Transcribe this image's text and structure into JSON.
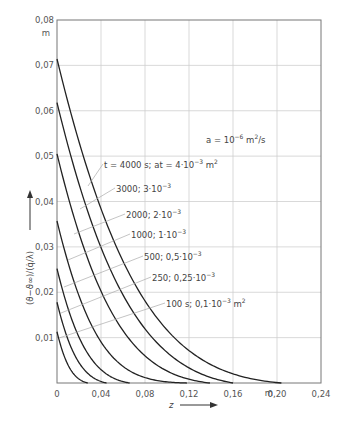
{
  "chart_data": {
    "type": "line",
    "title": "",
    "xlabel": "z",
    "x_unit": "m",
    "ylabel": "(ϑ − ϑ∞) / (q̇ / λ)",
    "y_unit": "m",
    "xlim": [
      0,
      0.24
    ],
    "ylim": [
      0,
      0.08
    ],
    "x_ticks": [
      "0",
      "0,04",
      "0,08",
      "0,12",
      "0,16",
      "0,20",
      "0,24"
    ],
    "y_ticks": [
      "0,01",
      "0,02",
      "0,03",
      "0,04",
      "0,05",
      "0,06",
      "0,07",
      "0,08"
    ],
    "grid": true,
    "annotation": "a = 10⁻⁶ m²/s",
    "series": [
      {
        "name": "t = 4000 s; at = 4·10⁻³ m²",
        "t_s": 4000,
        "at": 0.004,
        "y0": 0.0714,
        "z_end": 0.204
      },
      {
        "name": "3000; 3·10⁻³",
        "t_s": 3000,
        "at": 0.003,
        "y0": 0.0618,
        "z_end": 0.16
      },
      {
        "name": "2000; 2·10⁻³",
        "t_s": 2000,
        "at": 0.002,
        "y0": 0.0505,
        "z_end": 0.139
      },
      {
        "name": "1000; 1·10⁻³",
        "t_s": 1000,
        "at": 0.001,
        "y0": 0.0357,
        "z_end": 0.118
      },
      {
        "name": "500; 0,5·10⁻³",
        "t_s": 500,
        "at": 0.0005,
        "y0": 0.0252,
        "z_end": 0.066
      },
      {
        "name": "250; 0,25·10⁻³",
        "t_s": 250,
        "at": 0.00025,
        "y0": 0.0178,
        "z_end": 0.045
      },
      {
        "name": "100 s; 0,1·10⁻³ m²",
        "t_s": 100,
        "at": 0.0001,
        "y0": 0.0113,
        "z_end": 0.028
      }
    ]
  },
  "axes": {
    "y_unit_label": "m",
    "x_unit_label": "m",
    "x_var": "z",
    "y_label_text": "(ϑ−ϑ∞)/(q̇/λ)"
  },
  "labels": {
    "annotation_a": "a = 10",
    "annotation_a_exp": "−6",
    "annotation_a_unit": " m",
    "annotation_a_unit_exp": "2",
    "annotation_a_tail": "/s",
    "curve_labels": [
      {
        "main": "t = 4000 s;  at = 4·10",
        "exp": "−3",
        "unit": " m",
        "unit_exp": "2"
      },
      {
        "main": "3000;  3·10",
        "exp": "−3",
        "unit": "",
        "unit_exp": ""
      },
      {
        "main": "2000;  2·10",
        "exp": "−3",
        "unit": "",
        "unit_exp": ""
      },
      {
        "main": "1000;  1·10",
        "exp": "−3",
        "unit": "",
        "unit_exp": ""
      },
      {
        "main": "500;  0,5·10",
        "exp": "−3",
        "unit": "",
        "unit_exp": ""
      },
      {
        "main": "250;  0,25·10",
        "exp": "−3",
        "unit": "",
        "unit_exp": ""
      },
      {
        "main": "100 s;  0,1·10",
        "exp": "−3",
        "unit": " m",
        "unit_exp": "2"
      }
    ]
  }
}
